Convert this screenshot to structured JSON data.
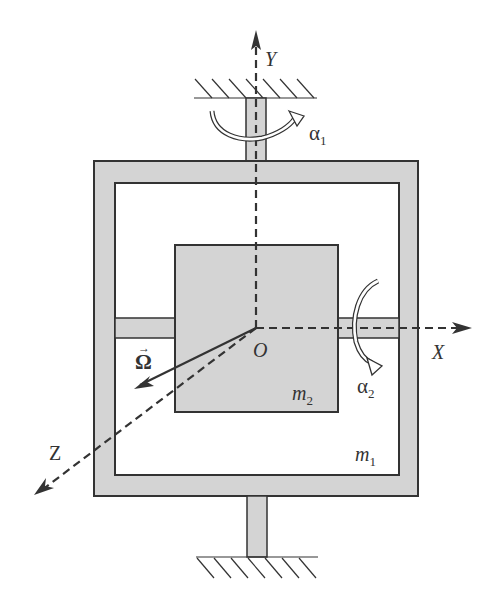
{
  "diagram": {
    "axes": {
      "x_label": "X",
      "y_label": "Y",
      "z_label": "Z",
      "origin_label": "O"
    },
    "masses": {
      "outer_frame": "m",
      "outer_frame_sub": "1",
      "inner_body": "m",
      "inner_body_sub": "2"
    },
    "rotations": {
      "alpha1": "α",
      "alpha1_sub": "1",
      "alpha2": "α",
      "alpha2_sub": "2"
    },
    "angular_velocity": "Ω",
    "angular_velocity_arrow": "→",
    "colors": {
      "fill": "#d4d4d4",
      "stroke": "#333333",
      "background": "#ffffff"
    }
  }
}
